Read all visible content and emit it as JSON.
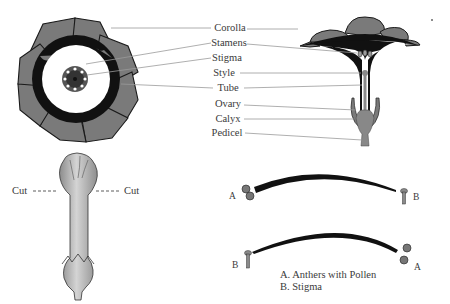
{
  "diagram": {
    "top_view": {
      "name": "flower top view"
    },
    "cross_section": {
      "name": "flower cross section"
    },
    "labels": [
      {
        "id": "corolla",
        "text": "Corolla"
      },
      {
        "id": "stamens",
        "text": "Stamens"
      },
      {
        "id": "stigma",
        "text": "Stigma"
      },
      {
        "id": "style",
        "text": "Style"
      },
      {
        "id": "tube",
        "text": "Tube"
      },
      {
        "id": "ovary",
        "text": "Ovary"
      },
      {
        "id": "calyx",
        "text": "Calyx"
      },
      {
        "id": "pedicel",
        "text": "Pedicel"
      }
    ],
    "bud": {
      "cut_left": "Cut",
      "cut_right": "Cut"
    },
    "pollination": {
      "top_left": "A",
      "top_right": "B",
      "bottom_left": "B",
      "bottom_right": "A",
      "legend": [
        "A. Anthers with Pollen",
        "B. Stigma"
      ]
    },
    "colors": {
      "petal": "#7a7a7a",
      "petal_outline": "#1a1a1a",
      "dark_fringe": "#111111",
      "bud_fill": "#b8b8b8",
      "leader_line": "#9a9a9a",
      "text": "#3a3a3a"
    }
  }
}
